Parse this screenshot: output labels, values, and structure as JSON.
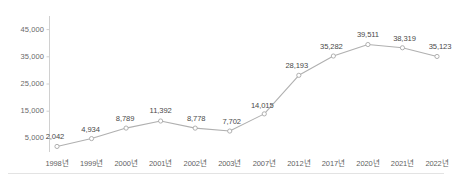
{
  "chart_data": {
    "type": "line",
    "title": "",
    "subtitle": "",
    "xlabel": "",
    "ylabel": "",
    "categories": [
      "1998년",
      "1999년",
      "2000년",
      "2001년",
      "2002년",
      "2003년",
      "2007년",
      "2012년",
      "2017년",
      "2020년",
      "2021년",
      "2022년"
    ],
    "values": [
      2042,
      4934,
      8789,
      11392,
      8778,
      7702,
      14015,
      28193,
      35282,
      39511,
      38319,
      35123
    ],
    "point_labels": [
      "2,042",
      "4,934",
      "8,789",
      "11,392",
      "8,778",
      "7,702",
      "14,015",
      "28,193",
      "35,282",
      "39,511",
      "38,319",
      "35,123"
    ],
    "ylim": [
      0,
      50000
    ],
    "yticks": [
      5000,
      15000,
      25000,
      35000,
      45000
    ],
    "ytick_labels": [
      "5,000",
      "15,000",
      "25,000",
      "35,000",
      "45,000"
    ],
    "grid": false,
    "legend": false,
    "series": [
      {
        "name": "",
        "values": [
          2042,
          4934,
          8789,
          11392,
          8778,
          7702,
          14015,
          28193,
          35282,
          39511,
          38319,
          35123
        ]
      }
    ],
    "colors": {
      "line": "#b0b0b0",
      "marker_fill": "#ffffff",
      "marker_stroke": "#a8a8a8",
      "axis": "#d0d0d0",
      "label_text": "#4a4a4a",
      "tick_text": "#6a6a6a",
      "background": "#ffffff"
    }
  }
}
